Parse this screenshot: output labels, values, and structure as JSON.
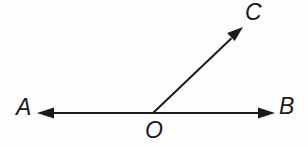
{
  "figure": {
    "kind": "geometry-angle-diagram",
    "width": 308,
    "height": 146,
    "background_color": "#fdfdfd",
    "stroke_color": "#1b1b1b",
    "stroke_width": 2,
    "labels": {
      "A": "A",
      "B": "B",
      "C": "C",
      "O": "O"
    },
    "points": {
      "O": {
        "x": 153,
        "y": 113
      },
      "A_tip": {
        "x": 37,
        "y": 113
      },
      "B_tip": {
        "x": 275,
        "y": 113
      },
      "C_tip": {
        "x": 243,
        "y": 27
      }
    },
    "rays": [
      {
        "name": "ray-OA",
        "from": "O",
        "to": "A_tip",
        "arrow": true
      },
      {
        "name": "ray-OB",
        "from": "O",
        "to": "B_tip",
        "arrow": true
      },
      {
        "name": "ray-OC",
        "from": "O",
        "to": "C_tip",
        "arrow": true
      }
    ]
  }
}
